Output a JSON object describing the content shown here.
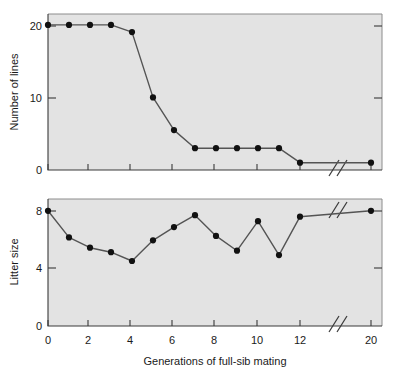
{
  "figure": {
    "background_color": "#ffffff",
    "plot_background_color": "#e3e3e3",
    "line_color": "#545454",
    "point_color": "#111111",
    "axis_color": "#3a3a3a"
  },
  "xaxis": {
    "label": "Generations of full-sib mating",
    "tick_labels": [
      "0",
      "2",
      "4",
      "6",
      "8",
      "10",
      "12",
      "20"
    ],
    "tick_values": [
      0,
      2,
      4,
      6,
      8,
      10,
      12,
      20
    ],
    "break_between": [
      12,
      20
    ],
    "break_symbol": "//"
  },
  "panels": {
    "top": {
      "ylabel": "Number of lines",
      "ytick_labels": [
        "0",
        "10",
        "20"
      ],
      "ytick_values": [
        0,
        10,
        20
      ],
      "ylim": [
        0,
        21.5
      ]
    },
    "bottom": {
      "ylabel": "Litter size",
      "ytick_labels": [
        "0",
        "4",
        "8"
      ],
      "ytick_values": [
        0,
        4,
        8
      ],
      "ylim": [
        0,
        8.6
      ]
    }
  },
  "chart_data": [
    {
      "type": "line",
      "title": "",
      "xlabel": "Generations of full-sib mating",
      "ylabel": "Number of lines",
      "x": [
        0,
        1,
        2,
        3,
        4,
        5,
        6,
        7,
        8,
        9,
        10,
        11,
        12,
        20
      ],
      "values": [
        20,
        20,
        20,
        20,
        19,
        10,
        5.5,
        3,
        3,
        3,
        3,
        3,
        1,
        1
      ],
      "xlim": [
        0,
        20
      ],
      "ylim": [
        0,
        21.5
      ],
      "xticks": [
        0,
        2,
        4,
        6,
        8,
        10,
        12,
        20
      ],
      "yticks": [
        0,
        10,
        20
      ],
      "grid": false,
      "legend": "none",
      "axis_break_x": [
        12,
        20
      ],
      "markers": "filled-circle"
    },
    {
      "type": "line",
      "title": "",
      "xlabel": "Generations of full-sib mating",
      "ylabel": "Litter size",
      "x": [
        0,
        1,
        2,
        3,
        4,
        5,
        6,
        7,
        8,
        9,
        10,
        11,
        12,
        20
      ],
      "values": [
        7.8,
        6.0,
        5.3,
        5.0,
        4.4,
        5.8,
        6.7,
        7.5,
        6.1,
        5.1,
        7.1,
        4.8,
        7.4,
        7.8
      ],
      "xlim": [
        0,
        20
      ],
      "ylim": [
        0,
        8.6
      ],
      "xticks": [
        0,
        2,
        4,
        6,
        8,
        10,
        12,
        20
      ],
      "yticks": [
        0,
        4,
        8
      ],
      "grid": false,
      "legend": "none",
      "axis_break_x": [
        12,
        20
      ],
      "markers": "filled-circle"
    }
  ]
}
